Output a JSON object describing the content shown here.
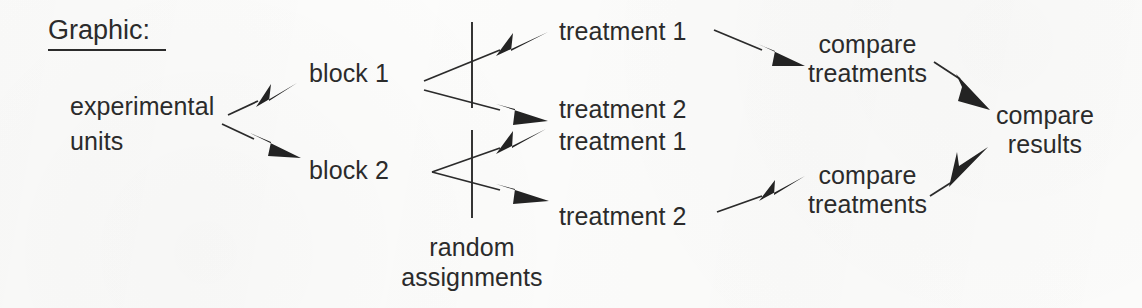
{
  "diagram": {
    "title": "Graphic:",
    "kind": "randomized-block-design-flow",
    "nodes": {
      "experimental_units_line1": "experimental",
      "experimental_units_line2": "units",
      "block1": "block 1",
      "block2": "block 2",
      "block1_treatment1": "treatment 1",
      "block1_treatment2": "treatment 2",
      "block2_treatment1": "treatment 1",
      "block2_treatment2": "treatment 2",
      "compare_treatments_top_line1": "compare",
      "compare_treatments_top_line2": "treatments",
      "compare_treatments_bottom_line1": "compare",
      "compare_treatments_bottom_line2": "treatments",
      "compare_results_line1": "compare",
      "compare_results_line2": "results",
      "random_assignments_line1": "random",
      "random_assignments_line2": "assignments"
    },
    "colors": {
      "ink": "#2b2b2b",
      "arrow_fill": "#232323",
      "background": "#fcfcfb"
    }
  }
}
